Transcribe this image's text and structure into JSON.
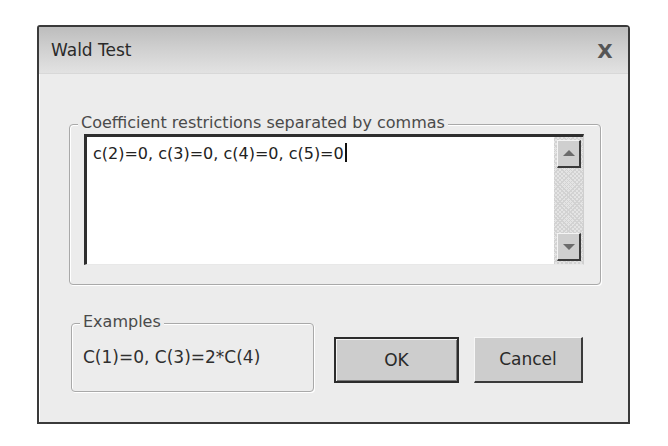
{
  "window": {
    "title": "Wald Test",
    "close_label": "X"
  },
  "restrictions": {
    "group_label": "Coefficient restrictions separated by commas",
    "value": "c(2)=0, c(3)=0, c(4)=0, c(5)=0",
    "scroll_up_icon": "arrow-up-icon",
    "scroll_down_icon": "arrow-down-icon"
  },
  "examples": {
    "group_label": "Examples",
    "text": "C(1)=0,  C(3)=2*C(4)"
  },
  "buttons": {
    "ok_label": "OK",
    "cancel_label": "Cancel"
  },
  "colors": {
    "dialog_bg": "#ececec",
    "frame": "#3a3a3a",
    "button_face": "#cdcdcd"
  }
}
